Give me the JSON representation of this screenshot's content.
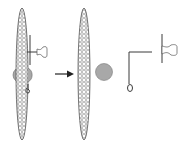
{
  "diagram": {
    "colors": {
      "stroke": "#3a3a3a",
      "fill_gray": "#a8a8a8",
      "pattern": "#888888",
      "background": "#ffffff"
    },
    "parts": [
      {
        "id": "assembled-panel",
        "label": "Assembled panel with clip, ball and hook"
      },
      {
        "id": "arrow",
        "label": "Disassembly arrow"
      },
      {
        "id": "bare-panel",
        "label": "Panel"
      },
      {
        "id": "ball",
        "label": "Ball"
      },
      {
        "id": "hook",
        "label": "L-shaped hook"
      },
      {
        "id": "clip",
        "label": "Clip"
      }
    ]
  }
}
